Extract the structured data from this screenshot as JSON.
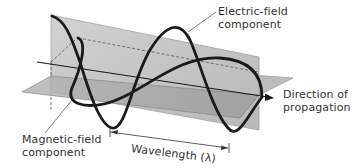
{
  "diagram": {
    "labels": {
      "electric_field": [
        "Electric-field",
        "component"
      ],
      "magnetic_field": [
        "Magnetic-field",
        "component"
      ],
      "direction": [
        "Direction of",
        "propagation"
      ],
      "wavelength": "Wavelength (λ)"
    },
    "colors": {
      "vertical_plane": "#c4c4c4",
      "horizontal_plane": "#a9a9a9",
      "wave_stroke": "#1a1a1a",
      "text": "#333333"
    }
  }
}
